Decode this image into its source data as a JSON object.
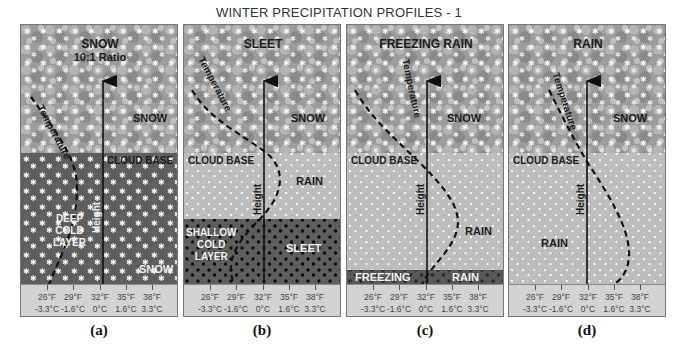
{
  "title": "WINTER PRECIPITATION PROFILES - 1",
  "axis": {
    "ticks_f": [
      "26°F",
      "29°F",
      "32°F",
      "35°F",
      "38°F"
    ],
    "ticks_c": [
      "-3.3°C",
      "-1.6°C",
      "0°C",
      "1.6°C",
      "3.3°C"
    ],
    "height_label": "Height",
    "temperature_label": "Temperature"
  },
  "panels": [
    {
      "caption": "(a)",
      "surface_type": "SNOW",
      "surface_sub": "10:1 Ratio",
      "upper_label": "SNOW",
      "cloud_base": "CLOUD BASE",
      "layer_label_lines": [
        "DEEP",
        "COLD",
        "LAYER"
      ],
      "lower_label": "SNOW"
    },
    {
      "caption": "(b)",
      "surface_type": "SLEET",
      "upper_label": "SNOW",
      "cloud_base": "CLOUD BASE",
      "middle_label": "RAIN",
      "layer_label_lines": [
        "SHALLOW",
        "COLD",
        "LAYER"
      ],
      "lower_label": "SLEET"
    },
    {
      "caption": "(c)",
      "surface_type": "FREEZING RAIN",
      "upper_label": "SNOW",
      "cloud_base": "CLOUD BASE",
      "middle_label": "RAIN",
      "bottom_left": "FREEZING",
      "bottom_right": "RAIN"
    },
    {
      "caption": "(d)",
      "surface_type": "RAIN",
      "upper_label": "SNOW",
      "cloud_base": "CLOUD BASE",
      "lower_label": "RAIN"
    }
  ],
  "colors": {
    "cloud_gray": "#9a9a9a",
    "rain_zone": "#bdbdbd",
    "cold_layer": "#5e5e5e",
    "axis_strip": "#d3d3d3"
  }
}
